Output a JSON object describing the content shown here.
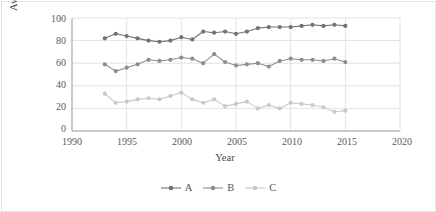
{
  "chart_data": {
    "type": "line",
    "title": "",
    "xlabel": "Year",
    "ylabel": "Average approval ratings per response, %",
    "xlim": [
      1990,
      2020
    ],
    "ylim": [
      0,
      100
    ],
    "xticks": [
      "1990",
      "1995",
      "2000",
      "2005",
      "2010",
      "2015",
      "2020"
    ],
    "yticks": [
      "0",
      "20",
      "40",
      "60",
      "80",
      "100"
    ],
    "grid": "horizontal-and-vertical",
    "legend_position": "bottom-center",
    "x": [
      1993,
      1994,
      1995,
      1996,
      1997,
      1998,
      1999,
      2000,
      2001,
      2002,
      2003,
      2004,
      2005,
      2006,
      2007,
      2008,
      2009,
      2010,
      2011,
      2012,
      2013,
      2014,
      2015
    ],
    "series": [
      {
        "name": "A",
        "color": "#767171",
        "values": [
          82,
          86,
          84,
          82,
          80,
          79,
          80,
          83,
          81,
          88,
          87,
          88,
          86,
          88,
          91,
          92,
          92,
          92,
          93,
          94,
          93,
          94,
          93
        ]
      },
      {
        "name": "B",
        "color": "#8e8e8e",
        "values": [
          59,
          53,
          56,
          59,
          63,
          62,
          63,
          65,
          64,
          60,
          68,
          61,
          58,
          59,
          60,
          57,
          62,
          64,
          63,
          63,
          62,
          64,
          61
        ]
      },
      {
        "name": "C",
        "color": "#c9c9c9",
        "values": [
          33,
          25,
          26,
          28,
          29,
          28,
          31,
          34,
          28,
          25,
          28,
          22,
          24,
          26,
          20,
          23,
          20,
          25,
          24,
          23,
          21,
          17,
          18
        ]
      }
    ]
  },
  "legend": {
    "items": [
      {
        "label": "A",
        "color": "#767171"
      },
      {
        "label": "B",
        "color": "#8e8e8e"
      },
      {
        "label": "C",
        "color": "#c9c9c9"
      }
    ]
  },
  "style": {
    "plot_background": "#ffffff",
    "grid_color": "#dcdcdc",
    "axis_color": "#b5b5b5",
    "page_border": "#e2e2e2",
    "text_color": "#5a5a5a"
  }
}
